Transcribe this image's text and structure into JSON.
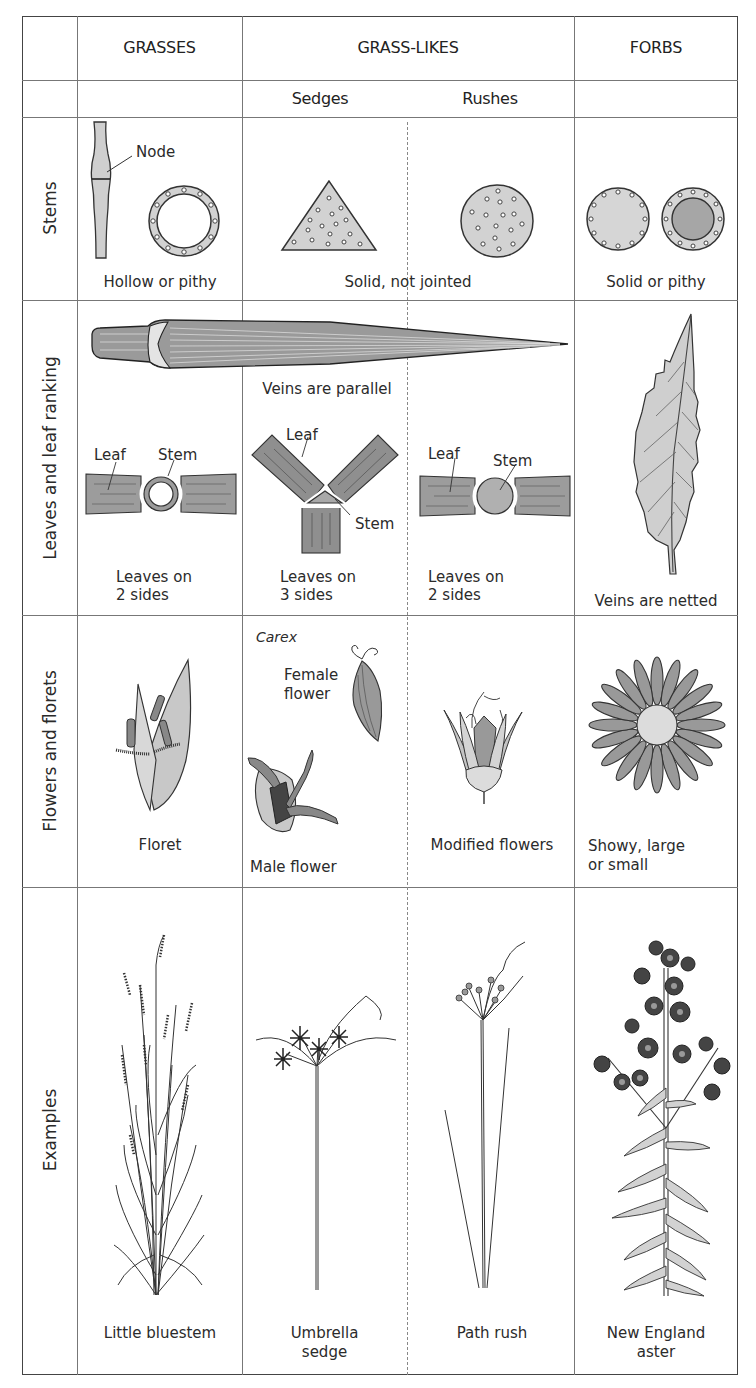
{
  "columns": {
    "grasses": "GRASSES",
    "grass_likes": "GRASS-LIKES",
    "forbs": "FORBS",
    "sub": {
      "sedges": "Sedges",
      "rushes": "Rushes"
    }
  },
  "rows": {
    "stems": {
      "label": "Stems",
      "grasses": {
        "caption": "Hollow or pithy",
        "callout": "Node"
      },
      "grass_likes": {
        "caption": "Solid, not jointed"
      },
      "forbs": {
        "caption": "Solid or pithy"
      }
    },
    "leaves": {
      "label": "Leaves and leaf ranking",
      "grass_like_leaf_caption": "Veins are parallel",
      "grasses": {
        "leaf_label": "Leaf",
        "stem_label": "Stem",
        "caption_line1": "Leaves on",
        "caption_line2": "2 sides"
      },
      "sedges": {
        "leaf_label": "Leaf",
        "stem_label": "Stem",
        "caption_line1": "Leaves on",
        "caption_line2": "3 sides"
      },
      "rushes": {
        "leaf_label": "Leaf",
        "stem_label": "Stem",
        "caption_line1": "Leaves on",
        "caption_line2": "2 sides"
      },
      "forbs": {
        "caption": "Veins are netted"
      }
    },
    "flowers": {
      "label": "Flowers and florets",
      "grasses": {
        "caption": "Floret"
      },
      "sedges": {
        "genus": "Carex",
        "female_line1": "Female",
        "female_line2": "flower",
        "male": "Male flower"
      },
      "rushes": {
        "caption": "Modified flowers"
      },
      "forbs": {
        "caption_line1": "Showy, large",
        "caption_line2": "or small"
      }
    },
    "examples": {
      "label": "Examples",
      "grasses": {
        "caption": "Little bluestem"
      },
      "sedges": {
        "caption_line1": "Umbrella",
        "caption_line2": "sedge"
      },
      "rushes": {
        "caption": "Path rush"
      },
      "forbs": {
        "caption_line1": "New England",
        "caption_line2": "aster"
      }
    }
  },
  "colors": {
    "line": "#777777",
    "fill_light": "#d4d4d4",
    "fill_mid": "#a8a8a8",
    "fill_dark": "#555555",
    "ink": "#2a2a2a"
  }
}
